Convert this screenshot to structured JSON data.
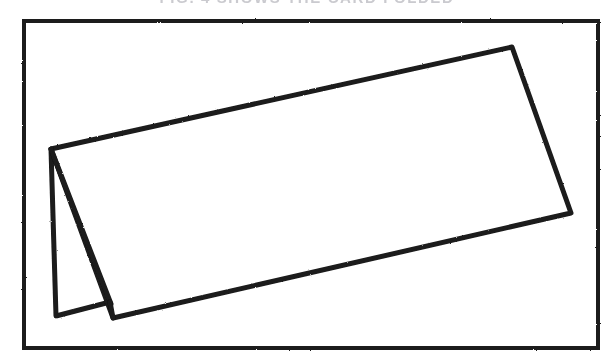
{
  "document": {
    "kind": "scanned-line-drawing",
    "page_background": "#ffffff",
    "ink_color": "#1a1a1a",
    "cut_off_caption_text": "FIG. 4   SHOWS THE CARD FOLDED"
  },
  "figure": {
    "frame": {
      "name": "figure-border",
      "x": 24,
      "y": 21,
      "width": 574,
      "height": 327,
      "stroke_color": "#1f1f1f",
      "stroke_width": 4,
      "fill": "#ffffff"
    },
    "shapes": [
      {
        "name": "back-panel",
        "description": "rear panel of the folded card, seen edge-on at left",
        "fill": "#ffffff",
        "stroke_color": "#1a1a1a",
        "stroke_width": 5,
        "points": "51,149 56,316 110,302"
      },
      {
        "name": "front-panel",
        "description": "large front panel of the folded card sloping down to the left",
        "fill": "#ffffff",
        "stroke_color": "#1a1a1a",
        "stroke_width": 5,
        "points": "51,149 512,47 571,213 113,318"
      }
    ],
    "lines": [
      {
        "name": "top-edge",
        "from_x": 51,
        "from_y": 149,
        "to_x": 512,
        "to_y": 47
      },
      {
        "name": "right-edge",
        "from_x": 512,
        "from_y": 47,
        "to_x": 571,
        "to_y": 213
      },
      {
        "name": "front-bottom-edge",
        "from_x": 571,
        "from_y": 213,
        "to_x": 113,
        "to_y": 318
      },
      {
        "name": "fold-crease-line",
        "from_x": 51,
        "from_y": 149,
        "to_x": 111,
        "to_y": 304
      },
      {
        "name": "back-left-edge",
        "from_x": 51,
        "from_y": 149,
        "to_x": 56,
        "to_y": 316
      },
      {
        "name": "back-bottom-edge",
        "from_x": 56,
        "from_y": 316,
        "to_x": 110,
        "to_y": 302
      },
      {
        "name": "fold-foot-edge",
        "from_x": 110,
        "from_y": 302,
        "to_x": 113,
        "to_y": 318
      }
    ]
  }
}
